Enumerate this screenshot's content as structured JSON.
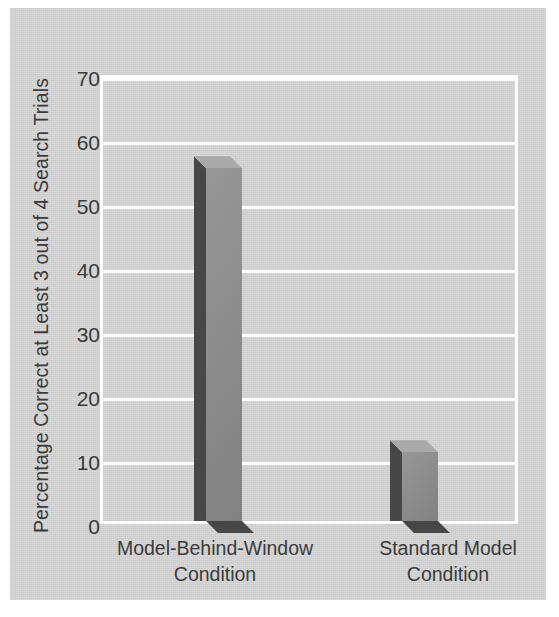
{
  "chart_data": {
    "type": "bar",
    "title": "",
    "subtitle": "",
    "xlabel": "",
    "ylabel": "Percentage Correct at Least 3 out of 4 Search Trials",
    "categories": [
      "Model-Behind-Window Condition",
      "Standard Model Condition"
    ],
    "category_lines": [
      [
        "Model-Behind-Window",
        "Condition"
      ],
      [
        "Standard Model",
        "Condition"
      ]
    ],
    "values": [
      56.5,
      11
    ],
    "ylim": [
      0,
      70
    ],
    "yticks": [
      0,
      10,
      20,
      30,
      40,
      50,
      60,
      70
    ],
    "ytick_labels": [
      "0",
      "10",
      "20",
      "30",
      "40",
      "50",
      "60",
      "70"
    ],
    "grid": "horizontal",
    "legend": "none",
    "style": "3d-bars",
    "colors": {
      "background": "#d4d4d4",
      "plot_background": "#d4d4d4",
      "gridline": "#fdfdfd",
      "frame": "#fdfdfd",
      "bar_front": "#8b8b8b",
      "bar_side": "#474747",
      "bar_top": "#a9a9a9",
      "text": "#3b3b3b"
    }
  }
}
